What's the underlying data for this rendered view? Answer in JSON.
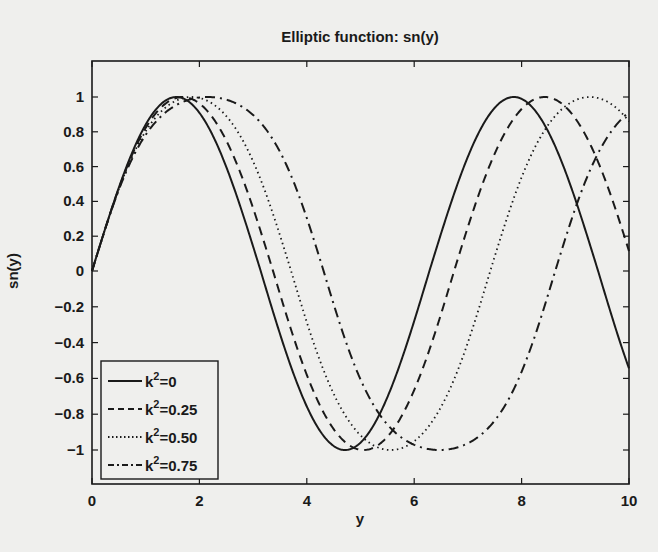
{
  "chart_data": {
    "type": "line",
    "title": "Elliptic function: sn(y)",
    "xlabel": "y",
    "ylabel": "sn(y)",
    "xlim": [
      0,
      10
    ],
    "ylim": [
      -1.15,
      1.2
    ],
    "xticks": [
      0,
      2,
      4,
      6,
      8,
      10
    ],
    "xtick_labels": [
      "0",
      "2",
      "4",
      "6",
      "8",
      "10"
    ],
    "yticks": [
      1,
      0.8,
      0.6,
      0.4,
      0.2,
      0,
      -0.2,
      -0.4,
      -0.6,
      -0.8,
      -1
    ],
    "ytick_labels": [
      "1",
      "0.8",
      "0.6",
      "0.4",
      "0.2",
      "0",
      "−0.2",
      "−0.4",
      "−0.6",
      "−0.8",
      "−1"
    ],
    "grid": false,
    "legend_position": "lower left",
    "series": [
      {
        "name": "k²=0",
        "label_base": "k",
        "label_sup": "2",
        "label_rest": "=0",
        "k2": 0,
        "style": "solid",
        "period": 6.2832,
        "first_max_x": 1.571,
        "first_min_x": 4.712
      },
      {
        "name": "k²=0.25",
        "label_base": "k",
        "label_sup": "2",
        "label_rest": "=0.25",
        "k2": 0.25,
        "style": "dashed",
        "period": 6.743,
        "first_max_x": 1.686,
        "first_min_x": 5.057
      },
      {
        "name": "k²=0.50",
        "label_base": "k",
        "label_sup": "2",
        "label_rest": "=0.50",
        "k2": 0.5,
        "style": "dotted",
        "period": 7.4163,
        "first_max_x": 1.854,
        "first_min_x": 5.562
      },
      {
        "name": "k²=0.75",
        "label_base": "k",
        "label_sup": "2",
        "label_rest": "=0.75",
        "k2": 0.75,
        "style": "dashdot",
        "period": 8.626,
        "first_max_x": 2.157,
        "first_min_x": 6.47
      }
    ]
  },
  "colors": {
    "line": "#1a1a1a",
    "background": "#efefed",
    "axes": "#1a1a1a"
  }
}
